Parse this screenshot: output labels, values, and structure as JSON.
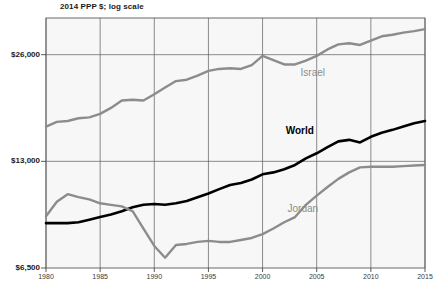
{
  "chart_data": {
    "type": "line",
    "title": "2014 PPP $; log scale",
    "xlabel": "",
    "ylabel": "",
    "yscale": "log",
    "ylim": [
      6500,
      33000
    ],
    "xlim": [
      1980,
      2015
    ],
    "grid": true,
    "legend_position": "inline-labels",
    "yticks": [
      "$26,000",
      "$13,000",
      "$6,500"
    ],
    "ytick_values": [
      26000,
      13000,
      6500
    ],
    "xticks": [
      "1980",
      "1985",
      "1990",
      "1995",
      "2000",
      "2005",
      "2010",
      "2015"
    ],
    "xtick_values": [
      1980,
      1985,
      1990,
      1995,
      2000,
      2005,
      2010,
      2015
    ],
    "x": [
      1980,
      1981,
      1982,
      1983,
      1984,
      1985,
      1986,
      1987,
      1988,
      1989,
      1990,
      1991,
      1992,
      1993,
      1994,
      1995,
      1996,
      1997,
      1998,
      1999,
      2000,
      2001,
      2002,
      2003,
      2004,
      2005,
      2006,
      2007,
      2008,
      2009,
      2010,
      2011,
      2012,
      2013,
      2014,
      2015
    ],
    "series": [
      {
        "name": "Israel",
        "color": "#8c8c8c",
        "label_year": 2006,
        "values": [
          16300,
          16800,
          16900,
          17200,
          17300,
          17700,
          18400,
          19300,
          19400,
          19300,
          20100,
          21000,
          21900,
          22100,
          22700,
          23400,
          23700,
          23800,
          23700,
          24300,
          25800,
          25100,
          24400,
          24400,
          25000,
          25800,
          26900,
          27800,
          28000,
          27700,
          28500,
          29300,
          29600,
          30000,
          30300,
          30700
        ]
      },
      {
        "name": "World",
        "color": "#000000",
        "label_year": 2005,
        "values": [
          8700,
          8700,
          8700,
          8750,
          8900,
          9050,
          9200,
          9400,
          9650,
          9800,
          9850,
          9800,
          9900,
          10050,
          10300,
          10550,
          10850,
          11150,
          11300,
          11550,
          11950,
          12100,
          12350,
          12700,
          13250,
          13700,
          14250,
          14800,
          14950,
          14700,
          15250,
          15650,
          15950,
          16300,
          16650,
          16900
        ]
      },
      {
        "name": "Jordan",
        "color": "#8c8c8c",
        "label_year": 2006,
        "values": [
          9100,
          10000,
          10500,
          10300,
          10150,
          9900,
          9800,
          9700,
          9400,
          8400,
          7500,
          6950,
          7550,
          7600,
          7700,
          7750,
          7700,
          7700,
          7800,
          7900,
          8100,
          8400,
          8750,
          9050,
          9800,
          10400,
          11000,
          11600,
          12100,
          12500,
          12550,
          12550,
          12550,
          12600,
          12650,
          12700
        ]
      }
    ]
  }
}
